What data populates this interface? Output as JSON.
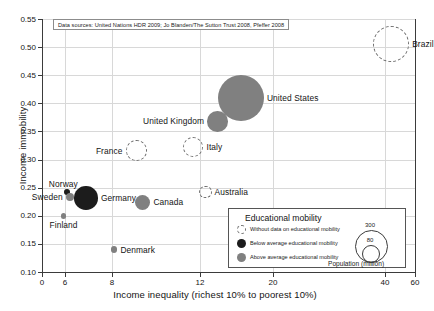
{
  "chart_data": {
    "type": "scatter",
    "title": "",
    "xlabel": "Income inequality (richest 10% to poorest 10%)",
    "ylabel": "Income immobility",
    "xticks": [
      0,
      6,
      8,
      12,
      20,
      40,
      60
    ],
    "xtick_labels": [
      "0",
      "6",
      "8",
      "12",
      "20",
      "40",
      "60"
    ],
    "yticks": [
      0.1,
      0.15,
      0.2,
      0.25,
      0.3,
      0.35,
      0.4,
      0.45,
      0.5,
      0.55
    ],
    "ytick_labels": [
      "0.10",
      "0.15",
      "0.20",
      "0.25",
      "0.30",
      "0.35",
      "0.40",
      "0.45",
      "0.50",
      "0.55"
    ],
    "xlim": [
      0,
      60
    ],
    "ylim": [
      0.1,
      0.55
    ],
    "x_axis_scale": "non-linear (irregular tick spacing)",
    "grid": true,
    "legend_position": "bottom-right",
    "size_variable": "Population (million)",
    "points": [
      {
        "name": "Brazil",
        "x": 44.0,
        "y": 0.505,
        "population": 195,
        "category": "nodata",
        "label_side": "right"
      },
      {
        "name": "United States",
        "x": 16.5,
        "y": 0.41,
        "population": 310,
        "category": "above",
        "label_side": "right"
      },
      {
        "name": "United Kingdom",
        "x": 13.9,
        "y": 0.368,
        "population": 62,
        "category": "above",
        "label_side": "left"
      },
      {
        "name": "Italy",
        "x": 11.7,
        "y": 0.322,
        "population": 60,
        "category": "nodata",
        "label_side": "right"
      },
      {
        "name": "France",
        "x": 9.1,
        "y": 0.316,
        "population": 63,
        "category": "nodata",
        "label_side": "left"
      },
      {
        "name": "Australia",
        "x": 12.6,
        "y": 0.243,
        "population": 22,
        "category": "nodata",
        "label_side": "right"
      },
      {
        "name": "Norway",
        "x": 6.1,
        "y": 0.242,
        "population": 5,
        "category": "below",
        "label_side": "above"
      },
      {
        "name": "Germany",
        "x": 6.9,
        "y": 0.232,
        "population": 82,
        "category": "below",
        "label_side": "right"
      },
      {
        "name": "Sweden",
        "x": 6.2,
        "y": 0.233,
        "population": 9,
        "category": "above",
        "label_side": "left"
      },
      {
        "name": "Canada",
        "x": 9.4,
        "y": 0.224,
        "population": 34,
        "category": "above",
        "label_side": "right"
      },
      {
        "name": "Finland",
        "x": 5.6,
        "y": 0.2,
        "population": 5,
        "category": "above",
        "label_side": "below"
      },
      {
        "name": "Denmark",
        "x": 8.1,
        "y": 0.14,
        "population": 6,
        "category": "above",
        "label_side": "right"
      }
    ],
    "source_note": "Data sources: United Nations HDR 2009; Jo Blanden/The Sutton Trust 2008, Pfeffer 2008",
    "legend": {
      "title": "Educational mobility",
      "entries": [
        {
          "key": "nodata",
          "label": "Without data on educational mobility"
        },
        {
          "key": "below",
          "label": "Below average educational mobility"
        },
        {
          "key": "above",
          "label": "Above average educational mobility"
        }
      ],
      "size_legend": {
        "caption": "Population (million)",
        "values": [
          "300",
          "80"
        ]
      }
    },
    "colors": {
      "below_average": "#1c1c1c",
      "above_average": "#808080",
      "no_data_stroke": "#6e6e6e",
      "grid": "#d8d8d8",
      "axis": "#3b3b3b",
      "text": "#141414",
      "background": "#ffffff"
    }
  }
}
